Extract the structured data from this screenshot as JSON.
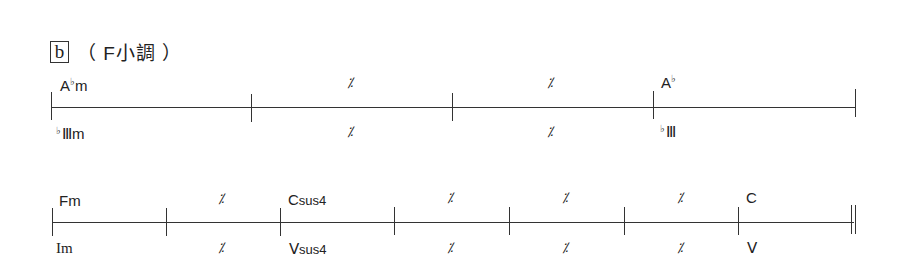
{
  "section": {
    "label": "b",
    "key": "（ F小調 ）"
  },
  "row1": {
    "measures": [
      {
        "chord_root": "A",
        "chord_acc": "♭",
        "chord_suffix": "m",
        "roman_acc": "♭",
        "roman": "Ⅲ",
        "roman_suffix": "m"
      },
      {
        "chord": "𝄎",
        "roman": "𝄎"
      },
      {
        "chord": "𝄎",
        "roman": "𝄎"
      },
      {
        "chord_root": "A",
        "chord_acc": "♭",
        "chord_suffix": "",
        "roman_acc": "♭",
        "roman": "Ⅲ",
        "roman_suffix": ""
      }
    ],
    "sim": "⁒"
  },
  "row2": {
    "measures": [
      {
        "chord": "Fm",
        "roman": "Im"
      },
      {
        "chord": "⁒",
        "roman": "⁒"
      },
      {
        "chord_root": "C",
        "chord_suffix": "sus4",
        "roman": "Ⅴ",
        "roman_suffix": "sus4"
      },
      {
        "chord": "⁒",
        "roman": "⁒"
      },
      {
        "chord": "⁒",
        "roman": "⁒"
      },
      {
        "chord": "⁒",
        "roman": "⁒"
      },
      {
        "chord": "C",
        "roman": "Ⅴ"
      }
    ]
  }
}
